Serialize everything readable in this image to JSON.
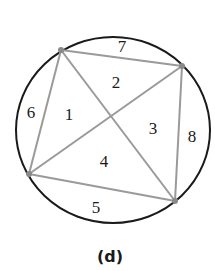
{
  "diagram": {
    "caption": "(d)",
    "circle": {
      "cx": 113,
      "cy": 130,
      "rx": 97,
      "ry": 93,
      "stroke": "#1a1a1a"
    },
    "vertices": [
      {
        "id": "A",
        "x": 61,
        "y": 50
      },
      {
        "id": "B",
        "x": 182,
        "y": 66
      },
      {
        "id": "C",
        "x": 175,
        "y": 201
      },
      {
        "id": "D",
        "x": 29,
        "y": 174
      }
    ],
    "edge_color": "#9a9a9a",
    "vertex_color": "#8a8a8a",
    "regions": [
      {
        "label": "1",
        "x": 69,
        "y": 120
      },
      {
        "label": "2",
        "x": 116,
        "y": 88
      },
      {
        "label": "3",
        "x": 153,
        "y": 134
      },
      {
        "label": "4",
        "x": 104,
        "y": 167
      },
      {
        "label": "5",
        "x": 96,
        "y": 213
      },
      {
        "label": "6",
        "x": 31,
        "y": 118
      },
      {
        "label": "7",
        "x": 122,
        "y": 52
      },
      {
        "label": "8",
        "x": 192,
        "y": 142
      }
    ]
  }
}
